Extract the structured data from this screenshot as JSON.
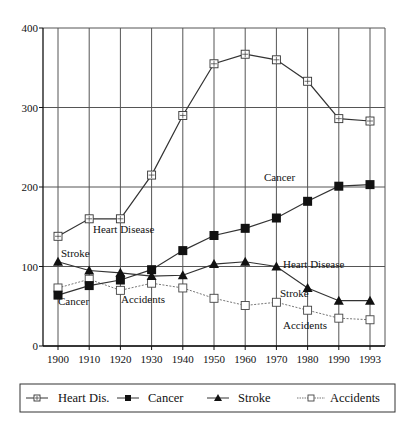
{
  "chart_data": {
    "type": "line",
    "title": "",
    "xlabel": "",
    "ylabel": "",
    "ylim": [
      0,
      400
    ],
    "yticks": [
      0,
      100,
      200,
      300,
      400
    ],
    "grid": true,
    "legend_position": "bottom",
    "x": [
      "1900",
      "1910",
      "1920",
      "1930",
      "1940",
      "1950",
      "1960",
      "1970",
      "1980",
      "1990",
      "1993"
    ],
    "series": [
      {
        "name": "Heart Dis.",
        "marker": "crossed-square",
        "line": "solid",
        "values": [
          138,
          160,
          160,
          215,
          290,
          355,
          367,
          360,
          333,
          286,
          283
        ]
      },
      {
        "name": "Cancer",
        "marker": "filled-square",
        "line": "solid",
        "values": [
          64,
          76,
          83,
          96,
          120,
          139,
          148,
          161,
          182,
          201,
          203
        ]
      },
      {
        "name": "Stroke",
        "marker": "filled-triangle",
        "line": "solid",
        "values": [
          106,
          95,
          92,
          88,
          89,
          103,
          106,
          100,
          73,
          57,
          57
        ]
      },
      {
        "name": "Accidents",
        "marker": "open-square",
        "line": "dotted",
        "values": [
          73,
          84,
          70,
          79,
          73,
          60,
          51,
          55,
          45,
          35,
          33
        ]
      }
    ],
    "annotations": [
      {
        "text": "Heart Disease",
        "x": "1920",
        "y": 160
      },
      {
        "text": "Heart Disease",
        "x": "1990",
        "y": 286
      },
      {
        "text": "Cancer",
        "x": "1990",
        "y": 201
      },
      {
        "text": "Stroke",
        "x": "1900",
        "y": 106
      },
      {
        "text": "Cancer",
        "x": "1900",
        "y": 64
      },
      {
        "text": "Accidents",
        "x": "1920",
        "y": 70
      },
      {
        "text": "Stroke",
        "x": "1990",
        "y": 57
      },
      {
        "text": "Accidents",
        "x": "1990",
        "y": 35
      }
    ]
  }
}
